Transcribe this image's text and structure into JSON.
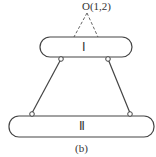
{
  "figure": {
    "point_label": "O(1,2)",
    "bar_top_label": "Ⅰ",
    "bar_bottom_label": "Ⅱ",
    "caption": "(b)"
  },
  "colors": {
    "stroke": "#444444",
    "dashed": "#666666",
    "text": "#333333"
  }
}
